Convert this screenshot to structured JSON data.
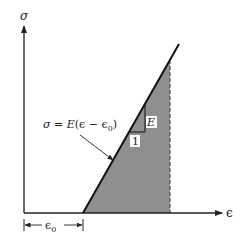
{
  "diagram": {
    "y_axis_label": "σ",
    "x_axis_label": "ϵ",
    "equation": "σ = E(ϵ − ϵ₀)",
    "equation_parts": {
      "lhs": "σ",
      "eq": " = ",
      "E": "E",
      "open": "(",
      "eps": "ϵ",
      "minus": " − ",
      "eps0": "ϵ",
      "sub0": "0",
      "close": ")"
    },
    "slope_rise_label": "E",
    "slope_run_label": "1",
    "offset_label": "ϵ",
    "offset_subscript": "0",
    "colors": {
      "line": "#111111",
      "fill": "#8f8f8f",
      "axis": "#222222",
      "label_bg": "#ffffff"
    }
  }
}
